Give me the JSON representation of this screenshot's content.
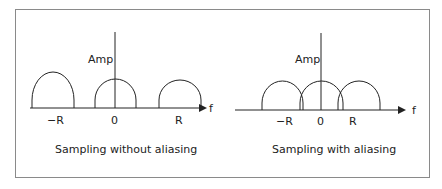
{
  "diagrams": [
    {
      "id": "left",
      "caption": "Sampling without aliasing",
      "y_axis_label": "Amp",
      "x_axis_label": "f",
      "tick_labels": [
        "−R",
        "0",
        "R"
      ]
    },
    {
      "id": "right",
      "caption": "Sampling with aliasing",
      "y_axis_label": "Amp",
      "x_axis_label": "f",
      "tick_labels": [
        "−R",
        "0",
        "R"
      ]
    }
  ],
  "colors": {
    "line": "#222222",
    "frame": "#8a8a8a"
  }
}
